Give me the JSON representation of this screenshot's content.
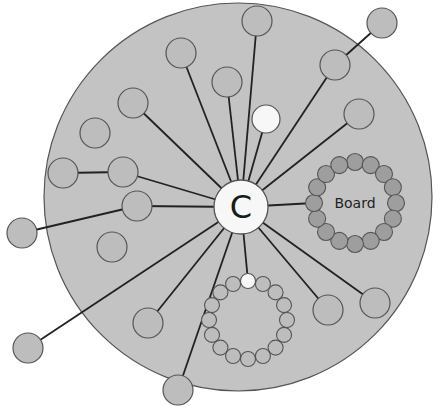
{
  "diagram": {
    "title": "",
    "colors": {
      "background_disc": "#c3c3c3",
      "disc_stroke": "#555555",
      "node_fill": "#bdbdbd",
      "node_stroke": "#555555",
      "highlight_fill": "#f7f7f7",
      "board_member_fill": "#9e9e9e",
      "edge": "#222222"
    },
    "disc": {
      "cx": 238,
      "cy": 197,
      "r": 194
    },
    "center_node": {
      "label": "C",
      "cx": 241,
      "cy": 207,
      "r": 27
    },
    "nodes": [
      {
        "id": "n1",
        "cx": 181,
        "cy": 53,
        "r": 15,
        "connected": true
      },
      {
        "id": "n2",
        "cx": 257,
        "cy": 21,
        "r": 15,
        "connected": true
      },
      {
        "id": "n3",
        "cx": 335,
        "cy": 65,
        "r": 15,
        "connected": true
      },
      {
        "id": "n4",
        "cx": 382,
        "cy": 23,
        "r": 15,
        "connected": false,
        "linked_to": "n3"
      },
      {
        "id": "n5",
        "cx": 227,
        "cy": 82,
        "r": 15,
        "connected": true
      },
      {
        "id": "n6",
        "cx": 133,
        "cy": 103,
        "r": 15,
        "connected": true
      },
      {
        "id": "n7",
        "cx": 266,
        "cy": 119,
        "r": 14,
        "connected": true,
        "highlight": true
      },
      {
        "id": "n8",
        "cx": 359,
        "cy": 114,
        "r": 15,
        "connected": true
      },
      {
        "id": "n9",
        "cx": 95,
        "cy": 133,
        "r": 15,
        "connected": false
      },
      {
        "id": "n10",
        "cx": 63,
        "cy": 173,
        "r": 15,
        "connected": false,
        "linked_to": "n11"
      },
      {
        "id": "n11",
        "cx": 123,
        "cy": 172,
        "r": 15,
        "connected": true
      },
      {
        "id": "n12",
        "cx": 137,
        "cy": 206,
        "r": 15,
        "connected": true
      },
      {
        "id": "n13",
        "cx": 22,
        "cy": 233,
        "r": 15,
        "connected": false,
        "linked_to": "n12"
      },
      {
        "id": "n14",
        "cx": 112,
        "cy": 247,
        "r": 15,
        "connected": false
      },
      {
        "id": "n15",
        "cx": 148,
        "cy": 323,
        "r": 15,
        "connected": true
      },
      {
        "id": "n16",
        "cx": 28,
        "cy": 348,
        "r": 15,
        "connected": true
      },
      {
        "id": "n17",
        "cx": 178,
        "cy": 390,
        "r": 15,
        "connected": true
      },
      {
        "id": "n18",
        "cx": 328,
        "cy": 310,
        "r": 15,
        "connected": true
      },
      {
        "id": "n19",
        "cx": 375,
        "cy": 303,
        "r": 15,
        "connected": true
      }
    ],
    "board": {
      "label": "Board",
      "cx": 355,
      "cy": 203,
      "ring_radius": 41,
      "member_count": 16,
      "member_r": 8.5,
      "connector_from_center": true
    },
    "committee": {
      "label": "",
      "cx": 248,
      "cy": 320,
      "ring_radius": 39,
      "member_count": 16,
      "member_r": 7.5,
      "highlight_index": 0
    }
  }
}
